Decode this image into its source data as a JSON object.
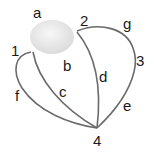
{
  "diagram": {
    "type": "graph",
    "region": {
      "label": "a",
      "fill": "#e8e8e8"
    },
    "vertices": [
      {
        "id": "1",
        "label": "1"
      },
      {
        "id": "2",
        "label": "2"
      },
      {
        "id": "3",
        "label": "3"
      },
      {
        "id": "4",
        "label": "4"
      }
    ],
    "edges": [
      {
        "label": "b",
        "from": "1",
        "to": "2"
      },
      {
        "label": "c",
        "from": "1",
        "to": "4"
      },
      {
        "label": "d",
        "from": "2",
        "to": "4"
      },
      {
        "label": "e",
        "from": "3",
        "to": "4"
      },
      {
        "label": "f",
        "from": "1",
        "to": "4"
      },
      {
        "label": "g",
        "from": "2",
        "to": "3"
      }
    ],
    "edge_color": "#6b6b6b"
  }
}
